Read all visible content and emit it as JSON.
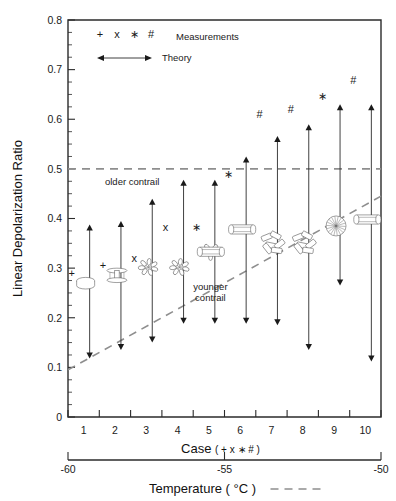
{
  "chart_data": {
    "type": "scatter",
    "title": "",
    "xlabel": "Case",
    "xlabel_suffix": "( + x ∗ # )",
    "ylabel": "Linear Depolarization Ratio",
    "secondary_xlabel": "Temperature ( °C )",
    "ylim": [
      0,
      0.8
    ],
    "ytick_labels": [
      "0",
      "0.1",
      "0.2",
      "0.3",
      "0.4",
      "0.5",
      "0.6",
      "0.7",
      "0.8"
    ],
    "ytick_values": [
      0,
      0.1,
      0.2,
      0.3,
      0.4,
      0.5,
      0.6,
      0.7,
      0.8
    ],
    "ytick_minor_step": 0.025,
    "categories": [
      "1",
      "2",
      "3",
      "4",
      "5",
      "6",
      "7",
      "8",
      "9",
      "10"
    ],
    "xlim": [
      0.5,
      10.5
    ],
    "grid": false,
    "legend_position": "top-left",
    "temperature_axis": {
      "ticks": [
        -60,
        -55,
        -50
      ],
      "tick_labels": [
        "-60",
        "-55",
        "-50"
      ]
    },
    "legend": [
      {
        "symbols": [
          "+",
          "x",
          "∗",
          "#"
        ],
        "label": "Measurements"
      },
      {
        "symbols": [
          "↔"
        ],
        "label": "Theory"
      }
    ],
    "annotations": [
      {
        "text": "older contrail",
        "x": 2.55,
        "y": 0.468
      },
      {
        "text": "younger contrail",
        "x": 5.05,
        "y": 0.255,
        "line2": "contrail"
      }
    ],
    "reference_lines": [
      {
        "name": "older-contrail-line",
        "type": "horizontal",
        "y": 0.5,
        "style": "dashed",
        "color": "#8e8e8e"
      },
      {
        "name": "younger-contrail-line",
        "type": "diagonal",
        "x0": 0.5,
        "y0": 0.095,
        "x1": 10.5,
        "y1": 0.445,
        "style": "dashed",
        "color": "#8e8e8e"
      }
    ],
    "series": [
      {
        "name": "Measurements",
        "values": [
          0.29,
          0.307,
          0.32,
          0.382,
          0.382,
          0.49,
          0.61,
          0.62,
          0.647,
          0.68
        ],
        "symbols": [
          "+",
          "+",
          "x",
          "x",
          "∗",
          "∗",
          "#",
          "#",
          "∗",
          "#"
        ]
      },
      {
        "name": "Theory",
        "lower": [
          0.118,
          0.135,
          0.15,
          0.188,
          0.188,
          0.188,
          0.185,
          0.135,
          0.265,
          0.112
        ],
        "upper": [
          0.388,
          0.395,
          0.44,
          0.478,
          0.478,
          0.525,
          0.566,
          0.59,
          0.63,
          0.63
        ]
      }
    ],
    "crystal_habits": [
      {
        "case": 1,
        "habit": "hexagonal-plate",
        "y": 0.268
      },
      {
        "case": 2,
        "habit": "capped-column",
        "y": 0.283
      },
      {
        "case": 3,
        "habit": "bullet-rosette",
        "y": 0.302
      },
      {
        "case": 4,
        "habit": "bullet-rosette",
        "y": 0.302
      },
      {
        "case": 5,
        "habit": "bullet-rosette-column",
        "y": 0.333
      },
      {
        "case": 6,
        "habit": "hollow-column",
        "y": 0.378
      },
      {
        "case": 7,
        "habit": "column-aggregate",
        "y": 0.352
      },
      {
        "case": 8,
        "habit": "column-aggregate",
        "y": 0.352
      },
      {
        "case": 9,
        "habit": "rosette-aggregate",
        "y": 0.385
      },
      {
        "case": 10,
        "habit": "hollow-column",
        "y": 0.398
      }
    ]
  }
}
